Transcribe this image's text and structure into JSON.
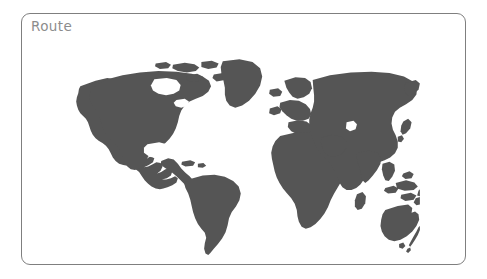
{
  "canvas": {
    "width": 487,
    "height": 279,
    "background": "#ffffff"
  },
  "card": {
    "title": "Route",
    "title_color": "#8c8c8c",
    "border_color": "#7f7f7f",
    "background": "#ffffff",
    "corner_radius": 9
  },
  "map": {
    "type": "world-silhouette",
    "projection": "equirectangular",
    "land_color": "#555555",
    "ocean_color": "#ffffff",
    "graticule": false,
    "markers": [],
    "route_path": [],
    "labels": [],
    "regions": [
      "North America",
      "Greenland",
      "South America",
      "Europe",
      "Africa",
      "Asia",
      "Southeast Asia",
      "Australia",
      "New Zealand"
    ]
  }
}
